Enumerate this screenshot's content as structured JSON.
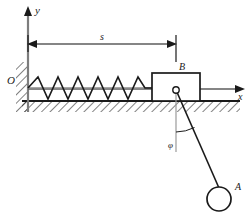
{
  "figure": {
    "type": "physics-mechanics-diagram",
    "background_color": "#ffffff",
    "line_color": "#1a1a1a"
  },
  "axes": {
    "origin_label": "O",
    "y_axis_label": "y",
    "x_axis_label": "x",
    "origin": {
      "x": 28,
      "y": 89
    },
    "y_axis_tip": {
      "x": 28,
      "y": 8
    },
    "x_axis_tip": {
      "x": 243,
      "y": 89
    }
  },
  "dimension": {
    "label": "s",
    "label_x": 103,
    "label_y": 38,
    "line_y": 44,
    "from_x": 28,
    "to_x": 176
  },
  "spring": {
    "anchor_x": 28,
    "end_x": 152,
    "center_y": 88,
    "amplitude": 11,
    "coils": 6
  },
  "block": {
    "label": "B",
    "label_x": 182,
    "label_y": 70,
    "left": 152,
    "top": 73,
    "right": 200,
    "bottom": 101
  },
  "ground": {
    "line_y": 101,
    "from_x": 22,
    "to_x": 240,
    "hatch_depth": 11
  },
  "wall": {
    "x": 28,
    "top": 62,
    "bottom": 112,
    "hatch_width": 12
  },
  "pendulum": {
    "pivot": {
      "x": 176,
      "y": 90
    },
    "bob_label": "A",
    "bob_label_x": 238,
    "bob_label_y": 187,
    "bob_center": {
      "x": 219,
      "y": 199
    },
    "bob_radius": 12,
    "angle_label": "φ",
    "angle_label_x": 172,
    "angle_label_y": 144,
    "vertical_ref_end_y": 152
  }
}
